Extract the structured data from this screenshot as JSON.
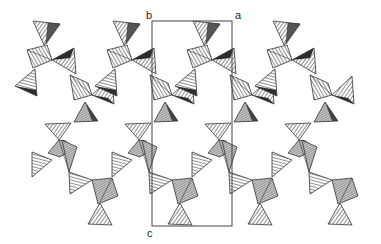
{
  "figure": {
    "type": "crystal-structure-polyhedral-projection",
    "unit_cell": {
      "axis_labels": {
        "a": "a",
        "b": "b",
        "c": "c"
      },
      "box": {
        "x": 152,
        "y": 21,
        "width": 80,
        "height": 205
      },
      "line_color": "#444444"
    },
    "colors": {
      "hatch_light": "#9a9a9a",
      "hatch_dark": "#3a3a3a",
      "edge": "#333333",
      "background": "#ffffff"
    },
    "repeat_period_x": 80,
    "column_offsets": [
      0,
      80,
      160,
      240
    ]
  }
}
